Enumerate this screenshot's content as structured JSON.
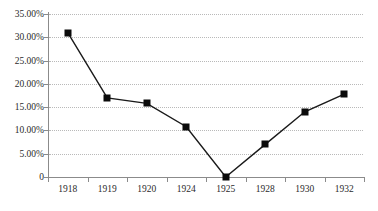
{
  "chart_data": {
    "type": "line",
    "title": "",
    "subtitle": "",
    "xlabel": "",
    "ylabel": "",
    "categories": [
      "1918",
      "1919",
      "1920",
      "1924",
      "1925",
      "1928",
      "1930",
      "1932"
    ],
    "values": [
      31.0,
      17.0,
      15.8,
      10.8,
      0.0,
      7.0,
      14.0,
      17.8
    ],
    "series": [
      {
        "name": "",
        "values": [
          31.0,
          17.0,
          15.8,
          10.8,
          0.0,
          7.0,
          14.0,
          17.8
        ]
      }
    ],
    "ylim": [
      0,
      35
    ],
    "ytick_values": [
      35,
      30,
      25,
      20,
      15,
      10,
      5,
      0
    ],
    "ytick_labels": [
      "35.00%",
      "30.00%",
      "25.00%",
      "20.00%",
      "15.00%",
      "10.00%",
      "5.00%",
      "0"
    ],
    "xtick_labels": [
      "1918",
      "1919",
      "1920",
      "1924",
      "1925",
      "1928",
      "1930",
      "1932"
    ],
    "grid": true,
    "grid_style": "dotted-horizontal",
    "legend": false,
    "legend_position": "none",
    "marker": "square",
    "marker_color": "#0b0b0b",
    "line_color": "#1a1a1a",
    "axis_color": "#8b8b8b",
    "grid_color": "#b9b9b9",
    "background_color": "#ffffff"
  }
}
